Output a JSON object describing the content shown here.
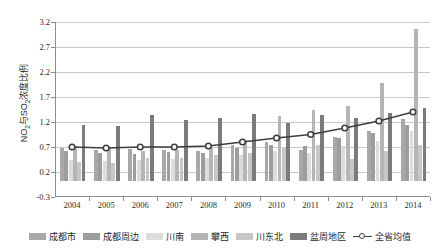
{
  "chart_data": {
    "type": "bar",
    "title": "",
    "xlabel": "",
    "ylabel": "NO2与SO2浓度比例",
    "ylim": [
      -0.3,
      3.2
    ],
    "yticks": [
      "3.2",
      "2.7",
      "2.2",
      "1.7",
      "1.2",
      "0.7",
      "0.2",
      "-0.3"
    ],
    "ytick_values": [
      3.2,
      2.7,
      2.2,
      1.7,
      1.2,
      0.7,
      0.2,
      -0.3
    ],
    "grid": true,
    "legend_position": "bottom",
    "categories": [
      "2004",
      "2005",
      "2006",
      "2007",
      "2008",
      "2009",
      "2010",
      "2011",
      "2012",
      "2013",
      "2014"
    ],
    "series": [
      {
        "name": "成都市",
        "type": "bar",
        "color": "#a8a8a8",
        "values": [
          0.66,
          0.62,
          0.64,
          0.63,
          0.6,
          0.72,
          0.78,
          0.62,
          0.88,
          1.01,
          1.25
        ]
      },
      {
        "name": "成都周边",
        "type": "bar",
        "color": "#9d9d9d",
        "values": [
          0.6,
          0.57,
          0.55,
          0.58,
          0.56,
          0.66,
          0.72,
          0.7,
          0.86,
          0.96,
          1.12
        ]
      },
      {
        "name": "川南",
        "type": "bar",
        "color": "#dcdcdc",
        "values": [
          0.43,
          0.4,
          0.42,
          0.44,
          0.46,
          0.52,
          0.6,
          0.57,
          0.7,
          0.8,
          1.0
        ]
      },
      {
        "name": "攀西",
        "type": "bar",
        "color": "#b5b5b5",
        "values": [
          0.7,
          0.66,
          0.6,
          0.62,
          0.66,
          0.83,
          1.3,
          1.42,
          1.5,
          1.97,
          3.05
        ]
      },
      {
        "name": "川东北",
        "type": "bar",
        "color": "#c7c7c7",
        "values": [
          0.38,
          0.36,
          0.46,
          0.47,
          0.52,
          0.57,
          0.66,
          0.72,
          0.45,
          0.6,
          0.73
        ]
      },
      {
        "name": "盆周地区",
        "type": "bar",
        "color": "#7b7b7b",
        "values": [
          1.13,
          1.1,
          1.33,
          1.22,
          1.27,
          1.35,
          1.17,
          1.33,
          1.26,
          1.36,
          1.47
        ]
      },
      {
        "name": "全省均值",
        "type": "line",
        "color": "#3d3d3d",
        "values": [
          0.7,
          0.68,
          0.7,
          0.7,
          0.72,
          0.8,
          0.88,
          0.95,
          1.08,
          1.22,
          1.4
        ]
      }
    ]
  },
  "axis": {
    "y_title_main": "NO",
    "y_title_sub1": "2",
    "y_title_mid": "与SO",
    "y_title_sub2": "2",
    "y_title_tail": "浓度比例"
  }
}
